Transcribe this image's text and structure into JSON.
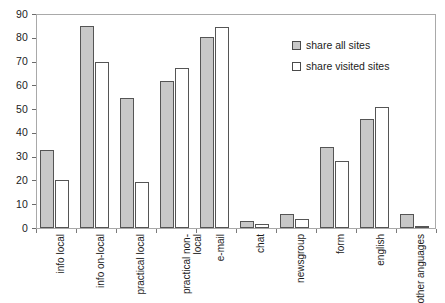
{
  "chart_data": {
    "type": "bar",
    "title": "",
    "subtitle": "",
    "xlabel": "",
    "ylabel": "",
    "ylim": [
      0,
      90
    ],
    "ytick_step": 10,
    "yticks": [
      0,
      10,
      20,
      30,
      40,
      50,
      60,
      70,
      80,
      90
    ],
    "grid": false,
    "legend_position": "inside upper-right",
    "orientation": "vertical",
    "xtick_label_rotation": 90,
    "categories": [
      "info local",
      "info on-local",
      "practical local",
      "practical non-local",
      "e-mail",
      "chat",
      "newsgroup",
      "form",
      "english",
      "other anguages"
    ],
    "series": [
      {
        "name": "share all sites",
        "color": "#c8c8c8",
        "edge_color": "#555555",
        "values": [
          33,
          85,
          54.5,
          62,
          80.5,
          3,
          6,
          34,
          46,
          6
        ]
      },
      {
        "name": "share visited sites",
        "color": "#ffffff",
        "edge_color": "#555555",
        "values": [
          20,
          70,
          19.5,
          67.5,
          84.5,
          1.5,
          4,
          28,
          51,
          1
        ]
      }
    ]
  },
  "legend": {
    "items": [
      {
        "label": "share all sites",
        "swatch": "grey-filled-square"
      },
      {
        "label": "share visited sites",
        "swatch": "white-square"
      }
    ]
  },
  "axes": {
    "y_tick_labels": [
      "90",
      "80",
      "70",
      "60",
      "50",
      "40",
      "30",
      "20",
      "10",
      "0"
    ],
    "x_tick_labels": [
      "info local",
      "info on-local",
      "practical local",
      "practical non-local",
      "e-mail",
      "chat",
      "newsgroup",
      "form",
      "english",
      "other anguages"
    ]
  },
  "colors": {
    "series_all_sites": "#c8c8c8",
    "series_visited_sites": "#ffffff",
    "bar_edge": "#555555",
    "frame": "#a9a9a9",
    "text": "#1c1c1c",
    "background": "#ffffff"
  }
}
